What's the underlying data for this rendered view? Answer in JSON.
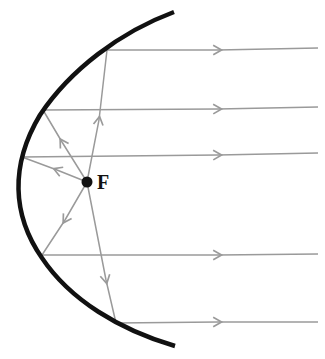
{
  "diagram": {
    "focus_label": "F",
    "colors": {
      "mirror": "#111111",
      "ray": "#9a9a9a",
      "focus": "#111111",
      "background": "#ffffff"
    },
    "focus_point": {
      "x": 87,
      "y": 182
    },
    "mirror": {
      "type": "parabola",
      "opens": "right",
      "vertex": {
        "x": 17,
        "y": 170
      },
      "top_end": {
        "x": 174,
        "y": 12
      },
      "bottom_end": {
        "x": 175,
        "y": 346
      }
    },
    "rays": [
      {
        "name": "ray-1",
        "reflect_point": {
          "x": 107,
          "y": 50
        },
        "exit_y": 49
      },
      {
        "name": "ray-2",
        "reflect_point": {
          "x": 43,
          "y": 110
        },
        "exit_y": 108
      },
      {
        "name": "ray-3",
        "reflect_point": {
          "x": 22,
          "y": 157
        },
        "exit_y": 154
      },
      {
        "name": "ray-4",
        "reflect_point": {
          "x": 42,
          "y": 255
        },
        "exit_y": 254
      },
      {
        "name": "ray-5",
        "reflect_point": {
          "x": 116,
          "y": 323
        },
        "exit_y": 322
      }
    ],
    "ray_end_x": 318
  }
}
